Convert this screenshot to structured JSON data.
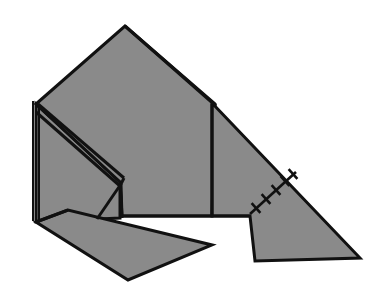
{
  "figure": {
    "canvas": {
      "width": 380,
      "height": 303,
      "background": "#ffffff"
    },
    "style": {
      "fill": "#8a8a8a",
      "stroke": "#111111",
      "stroke_width": 3,
      "thin_stroke_width": 2,
      "hatch_stroke_width": 2.6
    },
    "shapes": [
      {
        "name": "main-body-panel",
        "type": "polygon",
        "fill": "#8a8a8a",
        "stroke": "#111111",
        "stroke_width": 3,
        "points": "36,104 125,26 215,104 212,216 122,216 120,182"
      },
      {
        "name": "left-side-panel",
        "type": "polygon",
        "fill": "#8a8a8a",
        "stroke": "#111111",
        "stroke_width": 3,
        "points": "36,104 120,182 120,218 36,222"
      },
      {
        "name": "right-wing-panel",
        "type": "polygon",
        "fill": "#8a8a8a",
        "stroke": "#111111",
        "stroke_width": 3,
        "points": "212,103 360,258 255,261 250,216 212,216"
      },
      {
        "name": "bottom-flap-panel",
        "type": "polygon",
        "fill": "#8a8a8a",
        "stroke": "#111111",
        "stroke_width": 3,
        "points": "36,222 68,210 212,245 128,280"
      }
    ],
    "creases": [
      {
        "name": "crease-left-double-outer",
        "type": "line",
        "stroke": "#111111",
        "stroke_width": 2,
        "x1": 33,
        "y1": 101,
        "x2": 33,
        "y2": 221
      },
      {
        "name": "crease-left-double-inner",
        "type": "line",
        "stroke": "#111111",
        "stroke_width": 2,
        "x1": 39,
        "y1": 106,
        "x2": 39,
        "y2": 222
      },
      {
        "name": "crease-diagonal-upper",
        "type": "line",
        "stroke": "#111111",
        "stroke_width": 3,
        "x1": 38,
        "y1": 104,
        "x2": 124,
        "y2": 178
      },
      {
        "name": "crease-diagonal-lower",
        "type": "line",
        "stroke": "#111111",
        "stroke_width": 3,
        "x1": 36,
        "y1": 112,
        "x2": 120,
        "y2": 186
      },
      {
        "name": "crease-diagonal-cap",
        "type": "line",
        "stroke": "#111111",
        "stroke_width": 3,
        "x1": 120,
        "y1": 186,
        "x2": 124,
        "y2": 178
      },
      {
        "name": "crease-v-left",
        "type": "line",
        "stroke": "#111111",
        "stroke_width": 3,
        "x1": 121,
        "y1": 184,
        "x2": 97,
        "y2": 219
      },
      {
        "name": "crease-vertical-tab",
        "type": "line",
        "stroke": "#111111",
        "stroke_width": 3,
        "x1": 121,
        "y1": 184,
        "x2": 122,
        "y2": 218
      },
      {
        "name": "crease-center-vertical",
        "type": "line",
        "stroke": "#111111",
        "stroke_width": 3,
        "x1": 212,
        "y1": 104,
        "x2": 212,
        "y2": 216
      },
      {
        "name": "crease-ridge-right",
        "type": "line",
        "stroke": "#111111",
        "stroke_width": 3,
        "x1": 125,
        "y1": 26,
        "x2": 216,
        "y2": 106
      },
      {
        "name": "crease-baseline-horizontal",
        "type": "line",
        "stroke": "#111111",
        "stroke_width": 3,
        "x1": 122,
        "y1": 216,
        "x2": 250,
        "y2": 216
      },
      {
        "name": "crease-flap-top-edge",
        "type": "line",
        "stroke": "#111111",
        "stroke_width": 3,
        "x1": 36,
        "y1": 222,
        "x2": 68,
        "y2": 210
      }
    ],
    "hatched_crease": {
      "name": "hatched-stitch-crease",
      "type": "hatched-line",
      "stroke": "#111111",
      "stroke_width": 2.6,
      "x1": 250,
      "y1": 214,
      "x2": 296,
      "y2": 172,
      "tick_count": 5,
      "tick_length": 13,
      "ticks": [
        {
          "cx": 256,
          "cy": 208
        },
        {
          "cx": 266,
          "cy": 199
        },
        {
          "cx": 276,
          "cy": 190
        },
        {
          "cx": 285,
          "cy": 181
        },
        {
          "cx": 293,
          "cy": 174
        }
      ]
    },
    "vertices": {
      "apex": {
        "x": 125,
        "y": 26
      },
      "left_corner": {
        "x": 36,
        "y": 104
      },
      "left_bottom": {
        "x": 36,
        "y": 222
      },
      "right_shoulder": {
        "x": 215,
        "y": 104
      },
      "right_tip": {
        "x": 360,
        "y": 258
      },
      "notch_corner": {
        "x": 250,
        "y": 216
      },
      "notch_bottom": {
        "x": 255,
        "y": 261
      },
      "flap_tip_bottom": {
        "x": 128,
        "y": 280
      },
      "flap_tip_right": {
        "x": 212,
        "y": 245
      },
      "inner_junction": {
        "x": 121,
        "y": 184
      }
    }
  }
}
